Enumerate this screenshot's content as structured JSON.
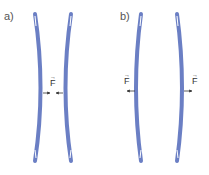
{
  "panels": [
    {
      "label": "a)",
      "force_label": "F",
      "force_direction": "inward (compression between rods)"
    },
    {
      "label": "b)",
      "force_label": "F",
      "force_direction": "outward"
    }
  ],
  "colors": {
    "rod": "#6b7fc4",
    "rod_edge": "#4a5ea8",
    "arrow": "#333333"
  }
}
